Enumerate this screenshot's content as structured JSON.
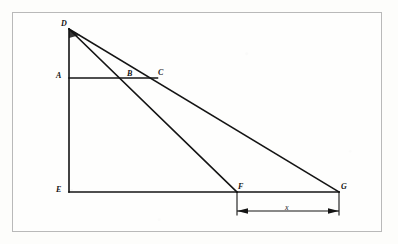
{
  "figure": {
    "type": "geometry-diagram",
    "stroke_color": "#141414",
    "frame_color": "#b9b9b9",
    "background_color": "#fdfdfb",
    "points": [
      {
        "id": "D",
        "label": "D",
        "x": 69,
        "y": 29,
        "label_x": 61,
        "label_y": 20
      },
      {
        "id": "A",
        "label": "A",
        "x": 69,
        "y": 78,
        "label_x": 56,
        "label_y": 72
      },
      {
        "id": "B",
        "label": "B",
        "x": 131,
        "y": 78,
        "label_x": 127,
        "label_y": 70
      },
      {
        "id": "C",
        "label": "C",
        "x": 157,
        "y": 78,
        "label_x": 158,
        "label_y": 69
      },
      {
        "id": "E",
        "label": "E",
        "x": 69,
        "y": 192,
        "label_x": 56,
        "label_y": 186
      },
      {
        "id": "F",
        "label": "F",
        "x": 237,
        "y": 192,
        "label_x": 238,
        "label_y": 183
      },
      {
        "id": "G",
        "label": "G",
        "x": 339,
        "y": 192,
        "label_x": 341,
        "label_y": 183
      }
    ],
    "segments": [
      {
        "name": "segment-DE",
        "from": "D",
        "to": "E",
        "note": "vertical left leg"
      },
      {
        "name": "segment-EG",
        "from": "E",
        "to": "G",
        "note": "horizontal base"
      },
      {
        "name": "segment-AC",
        "from": "A",
        "to": "C",
        "note": "horizontal midline through B to C"
      },
      {
        "name": "segment-DF",
        "from": "D",
        "to": "F",
        "note": "line from apex through B to F"
      },
      {
        "name": "segment-DG",
        "from": "D",
        "to": "G",
        "note": "line from apex through C to G"
      }
    ],
    "dimension": {
      "name": "dimension-x",
      "label": "x",
      "label_x": 285,
      "label_y": 204,
      "from_x": 237,
      "to_x": 339,
      "line_y": 211,
      "extension_top_y": 192,
      "arrow_style": "filled-triangle-both-ends"
    }
  }
}
